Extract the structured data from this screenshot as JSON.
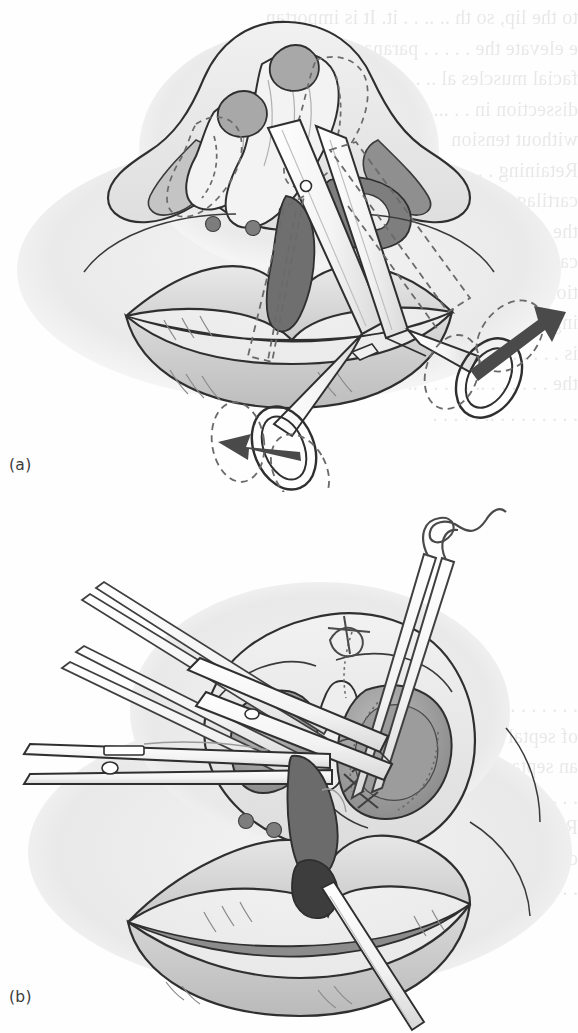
{
  "document": {
    "kind": "textbook-figure-page",
    "page_background": "#fefefe",
    "width_px": 578,
    "height_px": 1033
  },
  "figure": {
    "caption_style": "lettered-panels",
    "panels": [
      {
        "id": "a",
        "label": "(a)",
        "subject": "Cleft lip and nose repair — scissors undermining / dissection with alar cartilage repositioning",
        "elements": [
          "nose-and-lip-anatomy",
          "alar-cartilage-dashed-outline",
          "scissors-instrument",
          "scissors-dashed-ghost-outline",
          "movement-arrow-up-right",
          "movement-arrow-left",
          "vermilion-marking-dots"
        ]
      },
      {
        "id": "b",
        "label": "(b)",
        "subject": "Suture placement in nostril with forceps, needle holder and retractor on cleft lip",
        "elements": [
          "nose-base-view-with-nostrils",
          "suture-threads-and-knots",
          "forceps-instrument",
          "needle-holder-instrument",
          "scissors-instrument",
          "lips-with-cleft",
          "vermilion-marking-dots"
        ]
      }
    ]
  },
  "labels": {
    "panel_a": "(a)",
    "panel_b": "(b)"
  },
  "ghost_text": {
    "note": "faint show-through of printed text from the reverse side of the page (mirrored, illegible)",
    "right_column_top": [
      "to the lip, so th     ..   .. .  .    it. It is importan",
      "e  elevate the  .   .  .     .     .  paranas al and",
      "facial muscles  al  .. .   .    . .  subperiosteal",
      "dissection  in  .   .  ...  .   . . .  . flap  may",
      "without  tension"
    ],
    "right_column_upper2": [
      "Retaining  .   .   .   .  ..  .  . . . . septal",
      "cartilage  prov  .  .   .  .   .  . .  struts  for",
      "the  . . . .   .  . .  .  .  . .  . the  alar",
      "cartilage  be  .  .  .  .   .  .  . .  .  obstruc",
      "tion.  .  .   .  .   .  . .   .  . . . .  . plac",
      "ing  .  .   . .  .   .  . .   . . .  . nation",
      "is  .  . . .  .  .   .  . .  . .  .   . . . to",
      "the  . .  . . .  .  ..  .  .  . . . ..",
      ".  .  . . .  .   .  . ..  .  . .  . ."
    ],
    "left_column_mid": [
      ". .  .  . .  .  . .   .  . . .   .  .",
      "sle ction  .  .  .  .   .  .  .  .  .",
      ".   .  .  . . .   .  .  .  .   ."
    ],
    "lower_block": [
      ".  . .  .   . .  . .   .  .  . . .",
      "of  septal  .  . . .  .   . . . . .",
      "an  septa  . .  .  .  .   continuous",
      ".  . .  .   .  . . .  .   . . .  . .",
      "Retaining  .  .  .  . .  .  .  . the",
      "cartilage  .  .  .  . .  .  . . . . .",
      ".  .  . .   .  . .  .  .  .   .  .  ."
    ]
  },
  "palette": {
    "page": "#fefefe",
    "ink": "#3a3a3a",
    "outline": "#2f2f2f",
    "skin_light": "#f2f2f2",
    "skin_mid": "#e2e2e2",
    "skin_shadow": "#d2d2d2",
    "mucosa_mid": "#b9b9b9",
    "mucosa_dark": "#8d8d8d",
    "cleft_dark": "#6e6e6e",
    "cleft_darkest": "#4a4a4a",
    "instrument_fill": "#fbfbfb",
    "instrument_shade": "#e6e6e6",
    "dashed_guide": "#6a6a6a",
    "arrow": "#4a4a4a",
    "marking_dot": "#7d7d7d",
    "ghost_text": "#4a4a48"
  }
}
